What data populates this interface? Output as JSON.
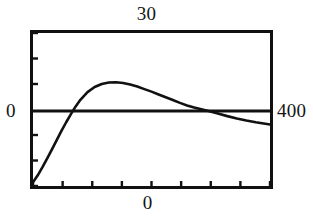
{
  "figure": {
    "name": "coordinate-plot"
  },
  "labels": {
    "top": "30",
    "bottom": "0",
    "left": "0",
    "right": "400"
  },
  "chart_data": {
    "type": "line",
    "title": "",
    "subtitle": "",
    "xlabel": "",
    "ylabel": "",
    "grid": false,
    "legend": null,
    "annotations": [
      {
        "name": "y-max-label",
        "text": "30",
        "position": "top-center-outside"
      },
      {
        "name": "y-zero-label",
        "text": "0",
        "position": "left-middle-outside"
      },
      {
        "name": "x-max-label",
        "text": "400",
        "position": "right-middle-outside"
      },
      {
        "name": "x-zero-label",
        "text": "0",
        "position": "bottom-center-outside"
      }
    ],
    "xlim": [
      0,
      400
    ],
    "ylim": [
      -30,
      30
    ],
    "zero_line_y": 0,
    "x_ticks": [
      0,
      50,
      100,
      150,
      200,
      250,
      300,
      350,
      400
    ],
    "y_ticks": [
      -30,
      -20,
      -10,
      0,
      10,
      20,
      30
    ],
    "series": [
      {
        "name": "curve",
        "color": "#111111",
        "x": [
          0,
          8,
          16,
          24,
          32,
          40,
          48,
          56,
          64,
          72,
          80,
          92,
          104,
          116,
          128,
          140,
          152,
          164,
          176,
          188,
          200,
          212,
          224,
          236,
          248,
          260,
          272,
          284,
          296,
          312,
          328,
          344,
          360,
          376,
          392,
          400
        ],
        "y": [
          -28.5,
          -25.8,
          -22.6,
          -19.2,
          -15.6,
          -12.0,
          -8.4,
          -5.0,
          -1.8,
          1.2,
          3.8,
          6.8,
          8.8,
          10.0,
          10.6,
          10.7,
          10.4,
          9.8,
          9.0,
          8.0,
          7.0,
          5.9,
          4.8,
          3.7,
          2.6,
          1.6,
          0.8,
          0.1,
          -0.6,
          -1.6,
          -2.6,
          -3.5,
          -4.3,
          -5.0,
          -5.6,
          -5.9
        ]
      }
    ]
  },
  "style": {
    "frame_color": "#111111",
    "curve_color": "#111111",
    "background": "#ffffff"
  }
}
